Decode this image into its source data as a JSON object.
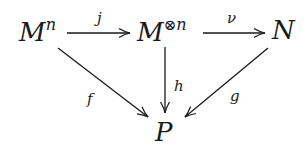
{
  "diagram": {
    "type": "commutative-diagram",
    "nodes": {
      "m_n": {
        "base": "M",
        "sup": "n"
      },
      "m_tensor_n": {
        "base": "M",
        "sup_symbol": "⊗",
        "sup": "n"
      },
      "n": {
        "base": "N"
      },
      "p": {
        "base": "P"
      }
    },
    "arrows": {
      "j": {
        "label": "j",
        "from": "M^n",
        "to": "M^⊗n"
      },
      "nu": {
        "label": "ν",
        "from": "M^⊗n",
        "to": "N"
      },
      "f": {
        "label": "f",
        "from": "M^n",
        "to": "P"
      },
      "h": {
        "label": "h",
        "from": "M^⊗n",
        "to": "P"
      },
      "g": {
        "label": "g",
        "from": "N",
        "to": "P"
      }
    },
    "colors": {
      "ink": "#1a1a1a",
      "background": "#ffffff"
    }
  }
}
